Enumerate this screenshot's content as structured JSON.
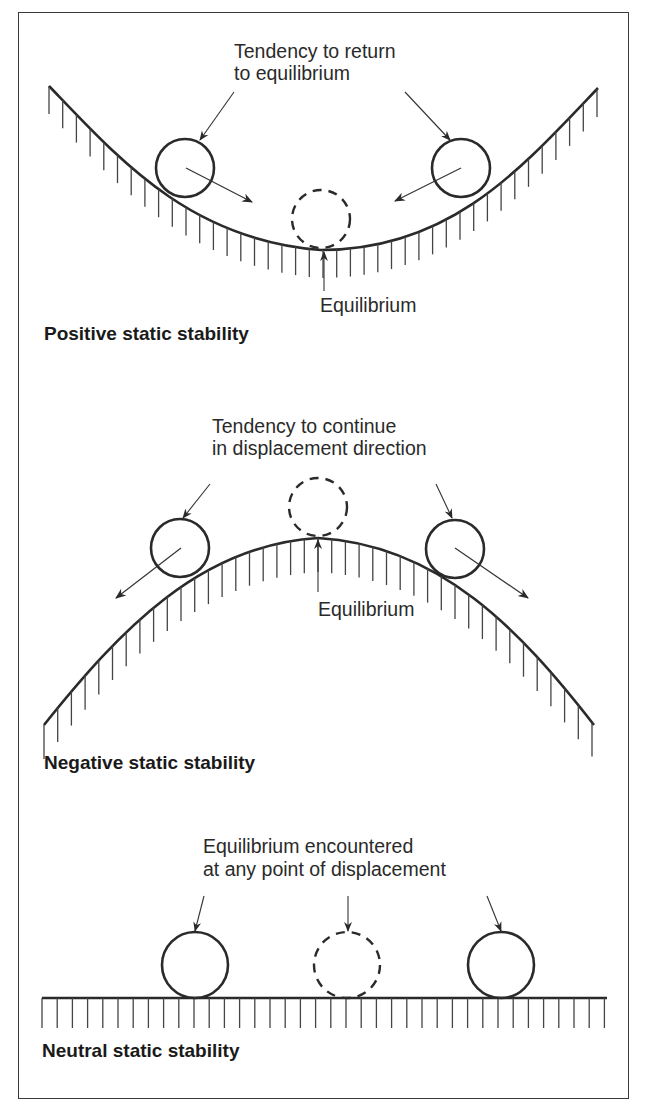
{
  "panels": {
    "positive": {
      "title": "Positive static stability",
      "annotation_line1": "Tendency to return",
      "annotation_line2": "to equilibrium",
      "equilibrium_label": "Equilibrium",
      "surface": "concave valley",
      "ball_tendency": "toward center"
    },
    "negative": {
      "title": "Negative static stability",
      "annotation_line1": "Tendency to continue",
      "annotation_line2": "in displacement direction",
      "equilibrium_label": "Equilibrium",
      "surface": "convex hill",
      "ball_tendency": "away from center"
    },
    "neutral": {
      "title": "Neutral static stability",
      "annotation_line1": "Equilibrium encountered",
      "annotation_line2": "at any point of displacement",
      "surface": "flat"
    }
  },
  "icons": {
    "ball": "solid-circle",
    "equilibrium_ball": "dashed-circle",
    "ground": "hatched-surface"
  },
  "colors": {
    "line": "#2a2a2a",
    "background": "#ffffff"
  }
}
